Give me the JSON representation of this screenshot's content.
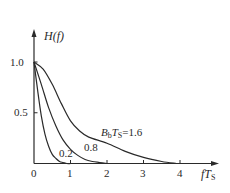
{
  "chart_data": {
    "type": "line",
    "title": "",
    "xlabel": "fT_S",
    "ylabel": "H(f)",
    "xlim": [
      0,
      4.8
    ],
    "ylim": [
      0,
      1.2
    ],
    "grid": false,
    "legend": "inline curve labels",
    "x_ticks": [
      "0",
      "1",
      "2",
      "3",
      "4"
    ],
    "y_ticks": [
      "0.5",
      "1.0"
    ],
    "series": [
      {
        "name": "B_bT_S=0.2",
        "label": "0.2",
        "x": [
          0,
          0.1,
          0.2,
          0.3,
          0.4,
          0.5,
          0.6,
          0.7,
          0.8,
          0.9,
          1.0
        ],
        "values": [
          1.0,
          0.72,
          0.47,
          0.29,
          0.17,
          0.09,
          0.05,
          0.02,
          0.01,
          0.0,
          0.0
        ]
      },
      {
        "name": "B_bT_S=0.8",
        "label": "0.8",
        "x": [
          0,
          0.2,
          0.4,
          0.6,
          0.8,
          1.0,
          1.2,
          1.4,
          1.6,
          1.8,
          2.0
        ],
        "values": [
          1.0,
          0.78,
          0.55,
          0.37,
          0.23,
          0.14,
          0.08,
          0.04,
          0.02,
          0.01,
          0.0
        ]
      },
      {
        "name": "B_bT_S=1.6",
        "label": "B_bT_S=1.6",
        "x": [
          0,
          0.25,
          0.5,
          0.75,
          1.0,
          1.25,
          1.5,
          2.0,
          2.5,
          3.0,
          3.5,
          3.9
        ],
        "values": [
          1.0,
          0.93,
          0.78,
          0.59,
          0.42,
          0.32,
          0.26,
          0.2,
          0.12,
          0.06,
          0.02,
          0.0
        ]
      }
    ]
  },
  "labels": {
    "y_axis": "H(f)",
    "x_axis_main": "fT",
    "x_axis_sub": "S",
    "tick_0": "0",
    "tick_1": "1",
    "tick_2": "2",
    "tick_3": "3",
    "tick_4": "4",
    "tick_y05": "0.5",
    "tick_y10": "1.0",
    "curve_02": "0.2",
    "curve_08": "0.8",
    "curve_16_B": "B",
    "curve_16_b": "b",
    "curve_16_T": "T",
    "curve_16_S": "S",
    "curve_16_val": "=1.6"
  }
}
